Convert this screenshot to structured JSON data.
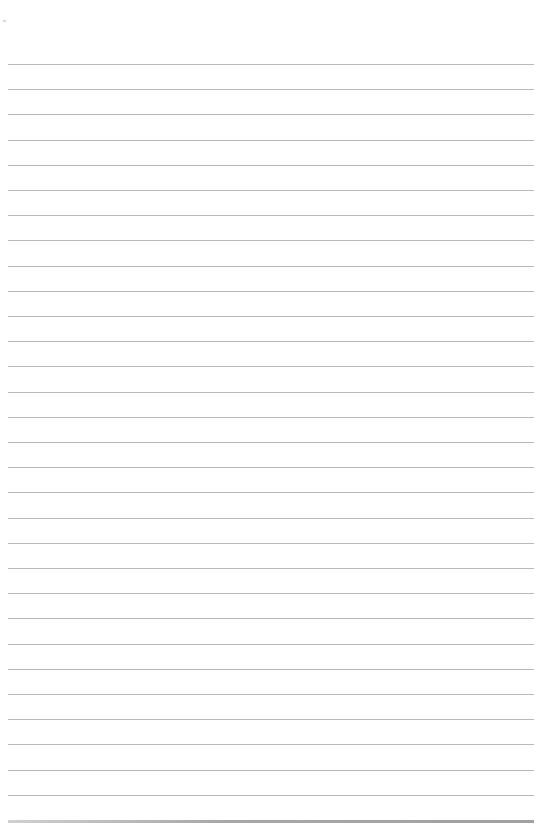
{
  "paper": {
    "type": "lined-paper",
    "background": "#ffffff",
    "line_color": "#b8b8b8",
    "first_line_y": 64,
    "line_spacing": 25.2,
    "line_count": 31,
    "line_left": 8,
    "line_width": 526
  }
}
